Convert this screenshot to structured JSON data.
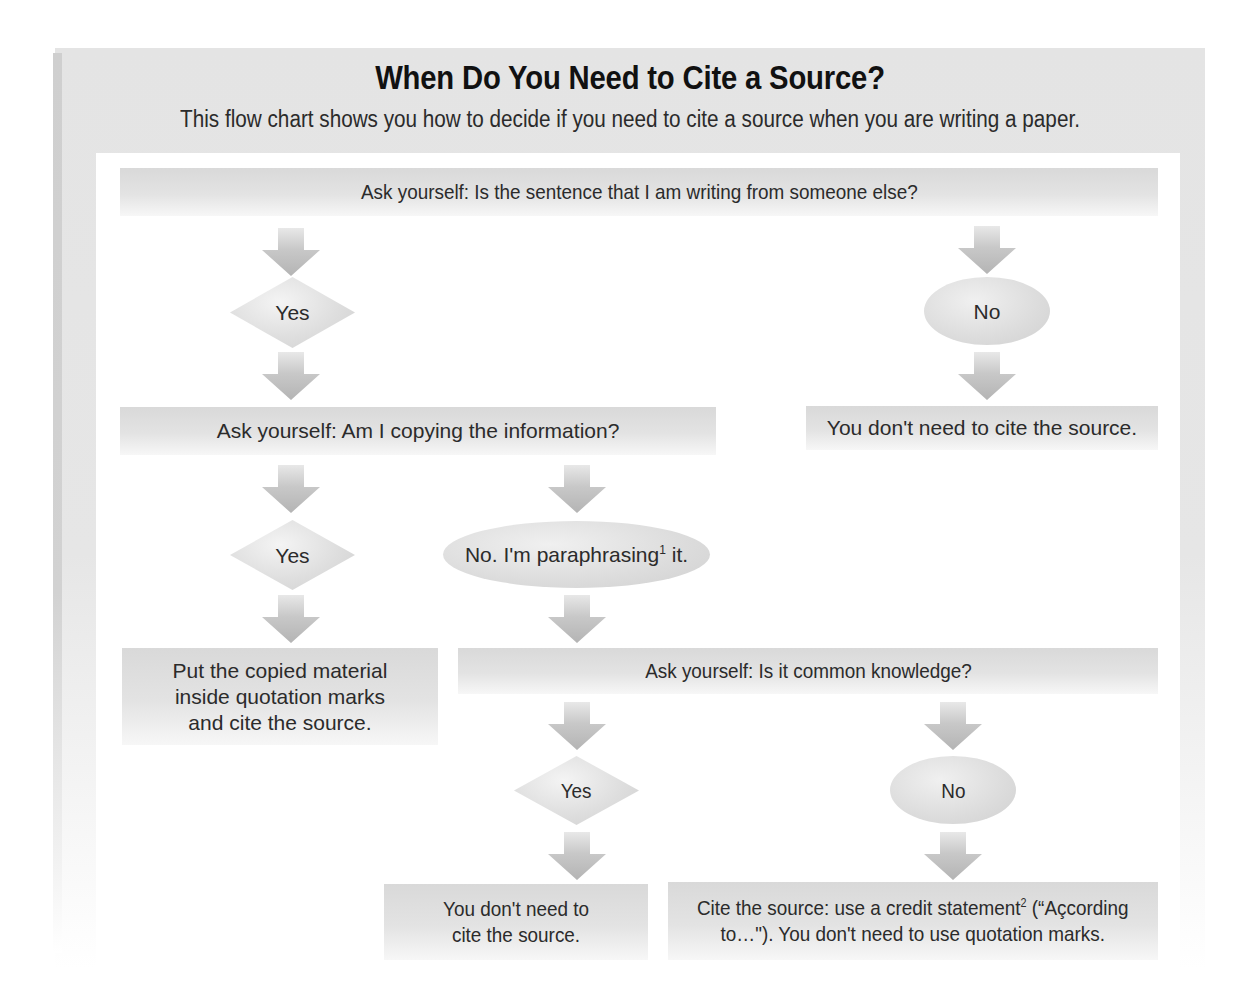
{
  "header": {
    "title": "When Do You Need to Cite a Source?",
    "subtitle": "This flow chart shows you how to decide if you need to cite a source when you are writing a paper."
  },
  "flowchart": {
    "q1": "Ask yourself: Is the sentence that I am writing from someone else?",
    "q1_yes": "Yes",
    "q1_no": "No",
    "q1_no_result": "You don't need to cite the source.",
    "q2": "Ask yourself: Am I copying the information?",
    "q2_yes": "Yes",
    "q2_no_line1": "No. I'm",
    "q2_no_line2": "paraphrasing",
    "q2_no_sup": "1",
    "q2_no_line2_end": " it.",
    "q2_yes_result": [
      "Put the copied material",
      "inside quotation marks",
      "and cite the source."
    ],
    "q3": "Ask yourself: Is it common knowledge?",
    "q3_yes": "Yes",
    "q3_no": "No",
    "q3_yes_result": [
      "You don't need to",
      "cite the source."
    ],
    "q3_no_result_line1_a": "Cite the source: use a credit statement",
    "q3_no_result_sup": "2",
    "q3_no_result_line1_b": " (“Açcording",
    "q3_no_result_line2": "to…\"). You don't need to use quotation marks."
  },
  "colors": {
    "frame": "#e4e4e4",
    "box": "#dcdcdc",
    "arrow": "#bdbdbd",
    "text": "#2b2b2b",
    "title": "#111111"
  }
}
